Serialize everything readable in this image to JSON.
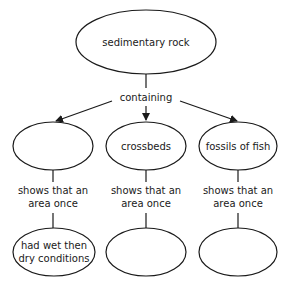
{
  "diagram": {
    "type": "concept-map",
    "root": {
      "label": "sedimentary rock"
    },
    "link_root": {
      "label": "containing"
    },
    "branches": [
      {
        "node": {
          "label": ""
        },
        "link": {
          "line1": "shows that an",
          "line2": "area once"
        },
        "result": {
          "line1": "had wet then",
          "line2": "dry conditions"
        }
      },
      {
        "node": {
          "label": "crossbeds"
        },
        "link": {
          "line1": "shows that an",
          "line2": "area once"
        },
        "result": {
          "line1": "",
          "line2": ""
        }
      },
      {
        "node": {
          "label": "fossils of fish"
        },
        "link": {
          "line1": "shows that an",
          "line2": "area once"
        },
        "result": {
          "line1": "",
          "line2": ""
        }
      }
    ]
  }
}
